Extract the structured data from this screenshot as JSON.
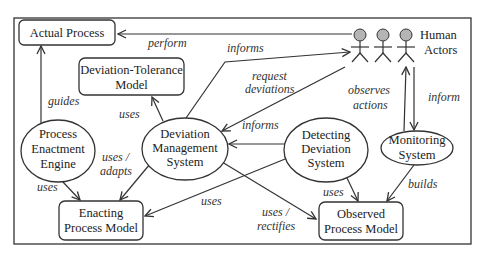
{
  "diagram": {
    "colors": {
      "stroke": "#333333",
      "actor_head": "#b5b5b5",
      "background": "#ffffff"
    },
    "nodes": {
      "actual_process": {
        "label": [
          "Actual Process"
        ],
        "shape": "rounded-rect"
      },
      "deviation_tolerance_model": {
        "label": [
          "Deviation-Tolerance",
          "Model"
        ],
        "shape": "rounded-rect"
      },
      "process_enactment_engine": {
        "label": [
          "Process",
          "Enactment",
          "Engine"
        ],
        "shape": "ellipse"
      },
      "deviation_management_system": {
        "label": [
          "Deviation",
          "Management",
          "System"
        ],
        "shape": "ellipse"
      },
      "detecting_deviation_system": {
        "label": [
          "Detecting",
          "Deviation",
          "System"
        ],
        "shape": "ellipse"
      },
      "monitoring_system": {
        "label": [
          "Monitoring",
          "System"
        ],
        "shape": "ellipse"
      },
      "enacting_process_model": {
        "label": [
          "Enacting",
          "Process Model"
        ],
        "shape": "rounded-rect"
      },
      "observed_process_model": {
        "label": [
          "Observed",
          "Process Model"
        ],
        "shape": "rounded-rect"
      },
      "human_actors": {
        "label": [
          "Human",
          "Actors"
        ],
        "shape": "actors",
        "count": 3
      }
    },
    "edges": [
      {
        "from": "human_actors",
        "to": "actual_process",
        "label": [
          "perform"
        ]
      },
      {
        "from": "process_enactment_engine",
        "to": "actual_process",
        "label": [
          "guides"
        ]
      },
      {
        "from": "deviation_management_system",
        "to": "human_actors",
        "label": [
          "informs"
        ]
      },
      {
        "from": "human_actors",
        "to": "deviation_management_system",
        "label": [
          "request",
          "deviations"
        ]
      },
      {
        "from": "deviation_management_system",
        "to": "deviation_tolerance_model",
        "label": [
          "uses"
        ]
      },
      {
        "from": "detecting_deviation_system",
        "to": "deviation_management_system",
        "label": [
          "informs"
        ]
      },
      {
        "from": "monitoring_system",
        "to": "human_actors",
        "label": [
          "observes",
          "actions"
        ]
      },
      {
        "from": "human_actors",
        "to": "monitoring_system",
        "label": [
          "inform"
        ]
      },
      {
        "from": "process_enactment_engine",
        "to": "enacting_process_model",
        "label": [
          "uses"
        ]
      },
      {
        "from": "deviation_management_system",
        "to": "enacting_process_model",
        "label": [
          "uses /",
          "adapts"
        ]
      },
      {
        "from": "detecting_deviation_system",
        "to": "enacting_process_model",
        "label": [
          "uses"
        ]
      },
      {
        "from": "deviation_management_system",
        "to": "observed_process_model",
        "label": [
          "uses /",
          "rectifies"
        ]
      },
      {
        "from": "detecting_deviation_system",
        "to": "observed_process_model",
        "label": [
          "uses"
        ]
      },
      {
        "from": "monitoring_system",
        "to": "observed_process_model",
        "label": [
          "builds"
        ]
      }
    ]
  }
}
